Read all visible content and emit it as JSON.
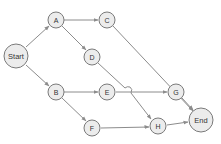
{
  "diagram": {
    "type": "directed-graph",
    "colors": {
      "node_fill": "#ececec",
      "node_stroke": "#7a7a7a",
      "edge": "#8c8c8c",
      "label": "#333333"
    },
    "nodes": {
      "start": {
        "label": "Start"
      },
      "a": {
        "label": "A"
      },
      "b": {
        "label": "B"
      },
      "c": {
        "label": "C"
      },
      "d": {
        "label": "D"
      },
      "e": {
        "label": "E"
      },
      "f": {
        "label": "F"
      },
      "g": {
        "label": "G"
      },
      "h": {
        "label": "H"
      },
      "end": {
        "label": "End"
      }
    },
    "edges": [
      {
        "from": "Start",
        "to": "A"
      },
      {
        "from": "Start",
        "to": "B"
      },
      {
        "from": "A",
        "to": "C"
      },
      {
        "from": "A",
        "to": "D"
      },
      {
        "from": "B",
        "to": "E"
      },
      {
        "from": "B",
        "to": "F"
      },
      {
        "from": "C",
        "to": "End"
      },
      {
        "from": "D",
        "to": "H"
      },
      {
        "from": "E",
        "to": "G"
      },
      {
        "from": "F",
        "to": "H"
      },
      {
        "from": "G",
        "to": "End"
      },
      {
        "from": "H",
        "to": "End"
      }
    ]
  }
}
